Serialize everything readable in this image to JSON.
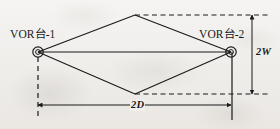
{
  "figure": {
    "type": "technical-diagram",
    "background_color": "#f2f0ee",
    "line_color": "#1a1a1a",
    "labels": {
      "station_left": "VOR台-1",
      "station_right": "VOR台-2",
      "dimension_vertical": "2W",
      "dimension_horizontal": "2D"
    },
    "nodes": [
      {
        "name": "vor-station-1",
        "label": "VOR台-1",
        "x": 38,
        "y": 52,
        "radius": 5
      },
      {
        "name": "vor-station-2",
        "label": "VOR台-2",
        "x": 231,
        "y": 52,
        "radius": 5
      }
    ],
    "vertices": [
      {
        "name": "top-vertex",
        "x": 135,
        "y": 15
      },
      {
        "name": "bottom-vertex",
        "x": 135,
        "y": 94
      }
    ],
    "dimensions": [
      {
        "name": "vertical-2W",
        "label": "2W",
        "from_y": 15,
        "to_y": 94,
        "x": 252,
        "orientation": "vertical"
      },
      {
        "name": "horizontal-2D",
        "label": "2D",
        "from_x": 38,
        "to_x": 232,
        "y": 105,
        "orientation": "horizontal"
      }
    ]
  }
}
